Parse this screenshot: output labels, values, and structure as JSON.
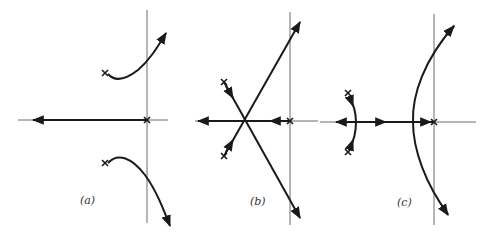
{
  "figure": {
    "colors": {
      "axis": "#6d6d6d",
      "locus": "#1a1a1a",
      "background": "#ffffff"
    },
    "panels": [
      {
        "id": "a",
        "label": "(a)",
        "poles": [
          "origin",
          "complex pair in left half-plane"
        ],
        "branches": [
          "real axis to -infinity",
          "upper branch curving into right half-plane",
          "lower branch curving into right half-plane"
        ]
      },
      {
        "id": "b",
        "label": "(b)",
        "poles": [
          "origin",
          "complex pair in left half-plane"
        ],
        "branches": [
          "straight asymptotes crossing at centroid",
          "real axis to -infinity"
        ]
      },
      {
        "id": "c",
        "label": "(c)",
        "poles": [
          "origin",
          "complex pair further left"
        ],
        "branches": [
          "small arc between complex poles to real axis",
          "parabolic branches into right half-plane",
          "real axis to -infinity"
        ]
      }
    ]
  }
}
